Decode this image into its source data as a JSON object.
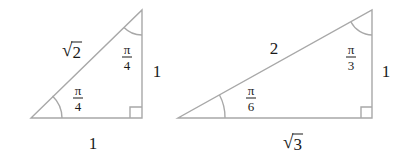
{
  "triangles": [
    {
      "name": "45-45-90 triangle",
      "hypotenuse": {
        "radicand": "2",
        "symbol": "√"
      },
      "vertical_side": "1",
      "base": "1",
      "angle_bottom_left": {
        "num": "π",
        "den": "4"
      },
      "angle_top": {
        "num": "π",
        "den": "4"
      },
      "right_angle_marker": true
    },
    {
      "name": "30-60-90 triangle",
      "hypotenuse": "2",
      "vertical_side": "1",
      "base": {
        "radicand": "3",
        "symbol": "√"
      },
      "angle_bottom_left": {
        "num": "π",
        "den": "6"
      },
      "angle_top": {
        "num": "π",
        "den": "3"
      },
      "right_angle_marker": true
    }
  ],
  "colors": {
    "line": "#a8a8a8",
    "text": "#1a1a1a",
    "background": "#ffffff"
  }
}
